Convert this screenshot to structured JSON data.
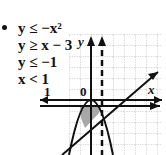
{
  "problem": {
    "bullet": "•",
    "inequalities": [
      {
        "text": "y ≤ −x²"
      },
      {
        "text": "y ≥ x − 3"
      },
      {
        "text": "y ≤ −1"
      },
      {
        "text": "x < 1"
      }
    ]
  },
  "graph": {
    "x_axis_label": "x",
    "y_axis_label": "y",
    "origin_label": "0",
    "tick_label_x1": "1",
    "colors": {
      "grid": "#9a9a9a",
      "lines": "#111111",
      "shade": "#9e9e9e"
    },
    "curves": [
      {
        "name": "parabola",
        "equation": "y = -x^2",
        "style": "solid"
      },
      {
        "name": "line",
        "equation": "y = x - 3",
        "style": "solid"
      },
      {
        "name": "horizontal",
        "equation": "y = -1",
        "style": "solid"
      },
      {
        "name": "vertical",
        "equation": "x = 1",
        "style": "dashed"
      }
    ]
  }
}
